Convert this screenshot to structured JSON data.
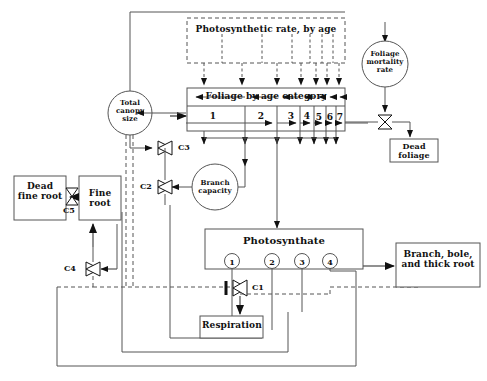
{
  "diagram": {
    "nodes": {
      "photo_rate": "Photosynthetic rate, by age",
      "foliage": "Foliage by age category",
      "foliage_mortality": "Foliage mortality rate",
      "dead_foliage": "Dead foliage",
      "total_canopy": "Total canopy size",
      "branch_capacity": "Branch capacity",
      "dead_fine_root": "Dead fine root",
      "fine_root": "Fine root",
      "photosynthate": "Photosynthate",
      "respiration": "Respiration",
      "branch_bole": "Branch, bole, and thick root"
    },
    "foliage_age_categories": [
      "1",
      "2",
      "3",
      "4",
      "5",
      "6",
      "7"
    ],
    "photosynthate_pathways": [
      "1",
      "2",
      "3",
      "4"
    ],
    "valves": [
      {
        "id": "C1",
        "label": "C1"
      },
      {
        "id": "C2",
        "label": "C2"
      },
      {
        "id": "C3",
        "label": "C3"
      },
      {
        "id": "C4",
        "label": "C4"
      },
      {
        "id": "C5",
        "label": "C5"
      }
    ],
    "colors": {
      "line": "#444444",
      "box_border": "#555555",
      "text": "#111111",
      "background": "#ffffff"
    }
  }
}
